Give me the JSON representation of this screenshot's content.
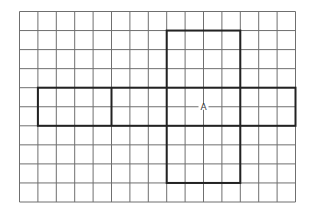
{
  "diagram": {
    "type": "grid-net",
    "grid": {
      "origin_x": 19.5,
      "origin_y": 11.5,
      "cols": 15,
      "rows": 10,
      "cell_w": 18.4,
      "cell_h": 19.05,
      "line_color": "#6f6f6f",
      "line_width": 1
    },
    "outline": {
      "color": "#222222",
      "width": 2,
      "segments_cells": [
        {
          "name": "vertical-bar",
          "x0": 8,
          "y0": 1,
          "x1": 12,
          "y1": 9
        },
        {
          "name": "horizontal-bar",
          "x0": 1,
          "y0": 4,
          "x1": 15,
          "y1": 6
        }
      ],
      "dividers_cells": [
        {
          "name": "divider-left",
          "x": 5,
          "y0": 4,
          "y1": 6
        }
      ]
    },
    "label": {
      "text": "A",
      "cell_x": 10,
      "cell_y": 5
    }
  }
}
